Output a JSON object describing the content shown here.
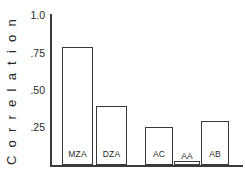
{
  "chart_data": {
    "type": "bar",
    "title": "",
    "xlabel": "",
    "ylabel": "C o r r e l a t i o n",
    "ylim": [
      0,
      1.0
    ],
    "grid": false,
    "legend": "none",
    "ytick_labels": [
      "1.0",
      ".75",
      ".50",
      ".25"
    ],
    "ytick_values": [
      1.0,
      0.75,
      0.5,
      0.25
    ],
    "categories": [
      "MZA",
      "DZA",
      "AC",
      "AA",
      "AB"
    ],
    "values": [
      0.78,
      0.39,
      0.25,
      0.03,
      0.29
    ],
    "bar_label_position": "inside-top",
    "groups": [
      {
        "name": "twins",
        "categories": [
          "MZA",
          "DZA"
        ]
      },
      {
        "name": "adoptive",
        "categories": [
          "AC",
          "AA",
          "AB"
        ]
      }
    ]
  },
  "bars": [
    {
      "label": "MZA",
      "value": 0.78
    },
    {
      "label": "DZA",
      "value": 0.39
    },
    {
      "label": "AC",
      "value": 0.25
    },
    {
      "label": "AA",
      "value": 0.03
    },
    {
      "label": "AB",
      "value": 0.29
    }
  ],
  "axis": {
    "y_title": "C o r r e l a t i o n",
    "ticks": [
      {
        "text": "1.0"
      },
      {
        "text": ".75"
      },
      {
        "text": ".50"
      },
      {
        "text": ".25"
      }
    ]
  },
  "colors": {
    "axis": "#3a3a3a",
    "bar_outline": "#3a3a3a",
    "bar_fill": "#ffffff",
    "text": "#2b2b2b",
    "background": "#ffffff"
  }
}
